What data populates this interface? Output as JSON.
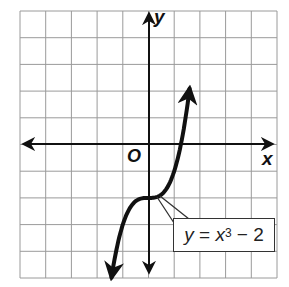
{
  "figure": {
    "axis_labels": {
      "x": "x",
      "y": "y",
      "origin": "O"
    },
    "equation_label": {
      "lhs": "y",
      "equals": "=",
      "var": "x",
      "exponent": "3",
      "rest": "− 2",
      "full": "y = x^3 − 2"
    },
    "grid": {
      "columns": 10,
      "rows": 10,
      "x_range": [
        -5,
        5
      ],
      "y_range": [
        -5,
        5
      ]
    },
    "colors": {
      "grid": "#9a9a9a",
      "axes": "#111111",
      "curve": "#111111",
      "label_border": "#333333"
    }
  },
  "chart_data": {
    "type": "line",
    "title": "",
    "xlabel": "x",
    "ylabel": "y",
    "xlim": [
      -5,
      5
    ],
    "ylim": [
      -5,
      5
    ],
    "grid": true,
    "series": [
      {
        "name": "y = x^3 - 2",
        "x": [
          -1.44,
          -1.25,
          -1.0,
          -0.75,
          -0.5,
          -0.25,
          0,
          0.25,
          0.5,
          0.75,
          1.0,
          1.25,
          1.5,
          1.6
        ],
        "values": [
          -4.99,
          -3.95,
          -3.0,
          -2.42,
          -2.13,
          -2.02,
          -2.0,
          -1.98,
          -1.88,
          -1.58,
          -1.0,
          -0.05,
          1.38,
          2.1
        ]
      }
    ],
    "annotations": [
      "y = x^3 − 2",
      "O"
    ],
    "legend": "none"
  }
}
